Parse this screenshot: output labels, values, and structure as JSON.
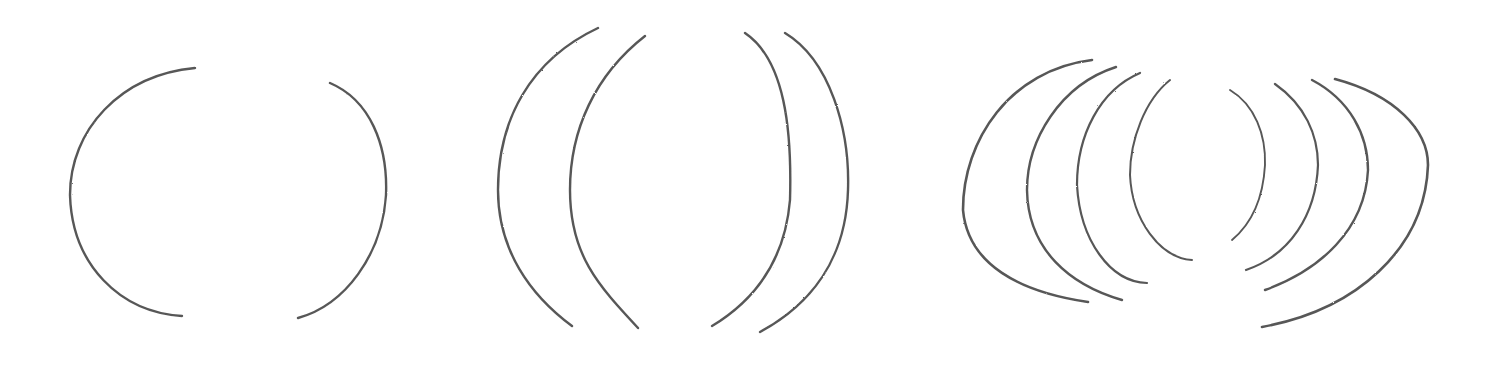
{
  "image": {
    "description": "Pencil sketch of curved parenthesis-like arcs in three groups",
    "background": "#ffffff",
    "stroke_color": "#3a3a3a",
    "groups": [
      {
        "name": "group-two-arcs",
        "arcs": [
          {
            "d": "M195,68 C120,75 70,130 70,195 C72,265 120,312 182,316",
            "w": 2.4
          },
          {
            "d": "M330,83 C370,100 388,145 386,195 C382,255 345,305 298,318",
            "w": 2.4
          }
        ]
      },
      {
        "name": "group-four-arcs",
        "arcs": [
          {
            "d": "M598,28 C530,60 498,120 498,190 C498,250 530,295 572,326",
            "w": 2.4
          },
          {
            "d": "M645,36 C595,75 570,130 570,190 C570,255 598,285 638,328",
            "w": 2.4
          },
          {
            "d": "M745,33 C785,60 792,130 790,200 C785,260 755,300 712,326",
            "w": 2.4
          },
          {
            "d": "M785,33 C830,60 850,130 848,190 C846,260 810,305 760,332",
            "w": 2.4
          }
        ]
      },
      {
        "name": "group-eight-arcs",
        "arcs": [
          {
            "d": "M1092,60 C1010,70 963,140 963,210 C968,265 1020,292 1088,302",
            "w": 2.6
          },
          {
            "d": "M1116,67 C1060,85 1027,140 1027,190 C1028,250 1070,285 1122,300",
            "w": 2.4
          },
          {
            "d": "M1140,73 C1100,90 1077,135 1077,185 C1080,240 1110,282 1147,283",
            "w": 2.2
          },
          {
            "d": "M1170,80 C1145,100 1130,140 1130,175 C1132,220 1160,258 1192,260",
            "w": 2.0
          },
          {
            "d": "M1230,90 C1255,105 1266,135 1265,165 C1263,200 1250,225 1232,240",
            "w": 1.9
          },
          {
            "d": "M1275,84 C1305,105 1318,135 1318,165 C1316,215 1290,255 1246,270",
            "w": 2.2
          },
          {
            "d": "M1312,80 C1350,100 1368,135 1368,170 C1365,230 1320,270 1265,290",
            "w": 2.4
          },
          {
            "d": "M1335,79 C1395,95 1428,130 1428,165 C1425,250 1355,310 1262,327",
            "w": 2.6
          }
        ]
      }
    ]
  }
}
